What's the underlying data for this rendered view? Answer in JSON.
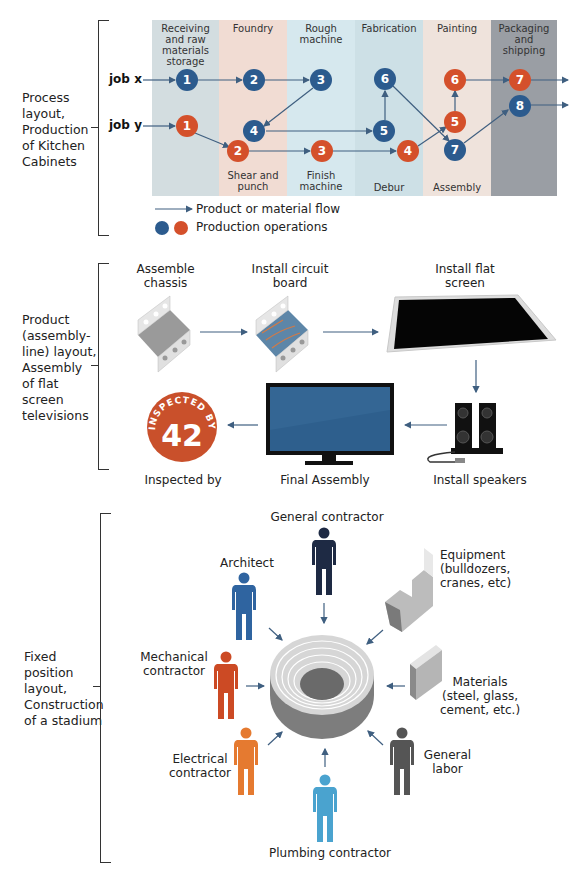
{
  "section1": {
    "side_label": [
      "Process",
      "layout,",
      "Production",
      "of Kitchen",
      "Cabinets"
    ],
    "columns": [
      {
        "top": "Receiving and raw materials storage",
        "bottom": "",
        "color": "#d3dde0"
      },
      {
        "top": "Foundry",
        "bottom": "Shear and punch",
        "color": "#f1dcd3"
      },
      {
        "top": "Rough machine",
        "bottom": "Finish machine",
        "color": "#cfe3ea"
      },
      {
        "top": "Fabrication",
        "bottom": "Debur",
        "color": "#c9dde3"
      },
      {
        "top": "Painting",
        "bottom": "Assembly",
        "color": "#efe1da"
      },
      {
        "top": "Packaging and shipping",
        "bottom": "",
        "color": "#8f9399"
      }
    ],
    "jobs": {
      "x": "job x",
      "y": "job y"
    },
    "job_x_nodes": [
      "1",
      "2",
      "3",
      "4",
      "5",
      "6",
      "7",
      "8"
    ],
    "job_y_nodes": [
      "1",
      "2",
      "3",
      "4",
      "5",
      "6",
      "7"
    ],
    "legend": {
      "flow": "Product or material flow",
      "ops": "Production operations"
    },
    "colors": {
      "job_x": "#2c5b8e",
      "job_y": "#d4502b",
      "arrow": "#3f5f80"
    }
  },
  "section2": {
    "side_label": [
      "Product",
      "(assembly-",
      "line) layout,",
      "Assembly",
      "of flat",
      "screen",
      "televisions"
    ],
    "steps": {
      "chassis": "Assemble chassis",
      "circuit": "Install circuit board",
      "screen": "Install flat screen",
      "speakers": "Install speakers",
      "final": "Final Assembly",
      "inspected": "Inspected by"
    },
    "badge": {
      "text": "INSPECTED BY",
      "number": "42",
      "color": "#c9502b"
    }
  },
  "section3": {
    "side_label": [
      "Fixed",
      "position",
      "layout,",
      "Construction",
      "of a stadium"
    ],
    "inputs": {
      "general_contractor": "General contractor",
      "architect": "Architect",
      "equipment": [
        "Equipment",
        "(bulldozers,",
        "cranes, etc)"
      ],
      "mechanical": [
        "Mechanical",
        "contractor"
      ],
      "materials": [
        "Materials",
        "(steel, glass,",
        "cement, etc.)"
      ],
      "electrical": [
        "Electrical",
        "contractor"
      ],
      "general_labor": [
        "General",
        "labor"
      ],
      "plumbing": "Plumbing contractor"
    },
    "person_colors": {
      "general_contractor": "#1e2a44",
      "architect": "#2f64a0",
      "mechanical": "#cc4a24",
      "electrical": "#e57a30",
      "general_labor": "#555555",
      "plumbing": "#4aa3cf"
    }
  }
}
